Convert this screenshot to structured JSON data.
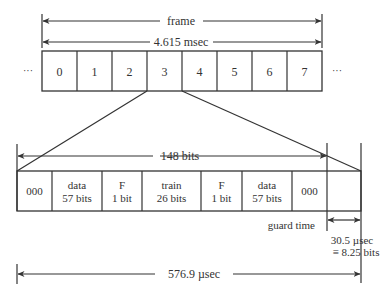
{
  "frame": {
    "label": "frame",
    "duration": "4.615 msec",
    "ellipsis_left": "···",
    "ellipsis_right": "···",
    "slots": [
      "0",
      "1",
      "2",
      "3",
      "4",
      "5",
      "6",
      "7"
    ]
  },
  "burst": {
    "length_label": "148 bits",
    "fields": [
      {
        "line1": "000",
        "line2": ""
      },
      {
        "line1": "data",
        "line2": "57 bits"
      },
      {
        "line1": "F",
        "line2": "1 bit"
      },
      {
        "line1": "train",
        "line2": "26 bits"
      },
      {
        "line1": "F",
        "line2": "1 bit"
      },
      {
        "line1": "data",
        "line2": "57 bits"
      },
      {
        "line1": "000",
        "line2": ""
      }
    ]
  },
  "guard": {
    "label": "guard time",
    "duration": "30.5 µsec",
    "equivalent": "≡ 8.25 bits"
  },
  "slot_duration": "576.9 µsec"
}
